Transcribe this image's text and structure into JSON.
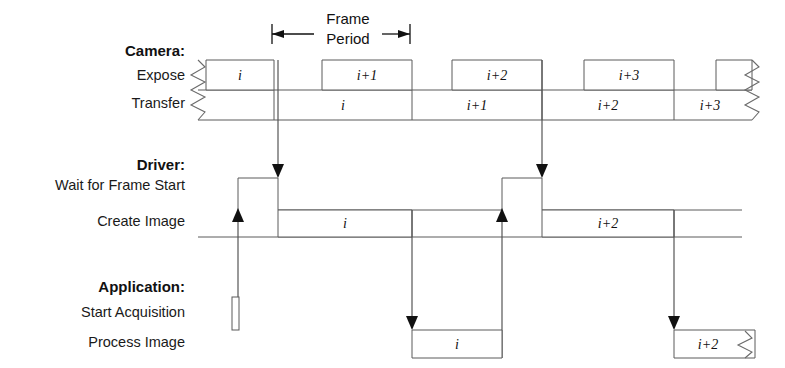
{
  "figure": {
    "type": "timing-diagram",
    "title_visible": false,
    "background_color": "#ffffff",
    "line_color": "#5a5a5a",
    "text_color": "#111111"
  },
  "annotations": {
    "frame_period_line1": "Frame",
    "frame_period_line2": "Period",
    "frame_period_span": {
      "x_start": 272,
      "x_end": 410
    }
  },
  "groups": [
    {
      "id": "camera",
      "title": "Camera:",
      "rows": [
        {
          "id": "expose",
          "label": "Expose"
        },
        {
          "id": "transfer",
          "label": "Transfer"
        }
      ]
    },
    {
      "id": "driver",
      "title": "Driver:",
      "rows": [
        {
          "id": "wait-for-frame-start",
          "label": "Wait for Frame Start"
        },
        {
          "id": "create-image",
          "label": "Create Image"
        }
      ]
    },
    {
      "id": "application",
      "title": "Application:",
      "rows": [
        {
          "id": "start-acquisition",
          "label": "Start Acquisition"
        },
        {
          "id": "process-image",
          "label": "Process Image"
        }
      ]
    }
  ],
  "blocks": {
    "expose": [
      {
        "label": "i",
        "x": 206,
        "w": 68
      },
      {
        "label": "i+1",
        "x": 322,
        "w": 90
      },
      {
        "label": "i+2",
        "x": 452,
        "w": 90
      },
      {
        "label": "i+3",
        "x": 584,
        "w": 90
      },
      {
        "label": "",
        "x": 716,
        "w": 40
      }
    ],
    "transfer": [
      {
        "label": "i",
        "x": 274,
        "w": 138
      },
      {
        "label": "i+1",
        "x": 412,
        "w": 130
      },
      {
        "label": "i+2",
        "x": 542,
        "w": 132
      },
      {
        "label": "i+3",
        "x": 674,
        "w": 68
      }
    ],
    "create_image": [
      {
        "label": "i",
        "x": 278,
        "w": 134
      },
      {
        "label": "i+2",
        "x": 542,
        "w": 132
      }
    ],
    "process_image": [
      {
        "label": "i",
        "x": 412,
        "w": 90
      },
      {
        "label": "i+2",
        "x": 674,
        "w": 85
      }
    ],
    "start_acquisition": [
      {
        "label": "",
        "x": 232,
        "w": 7
      }
    ]
  },
  "signal_edges": {
    "frame_start_arrows_x": [
      278,
      542
    ],
    "create_image_return_arrows_x": [
      238,
      502
    ],
    "process_image_arrows_x": [
      412,
      674
    ]
  },
  "zigzag_markers": {
    "left_break_x": 198,
    "right_break_camera_x": 752,
    "right_break_process_x": 755
  },
  "rows_geometry": {
    "expose_top": 60,
    "expose_bottom": 90,
    "transfer_top": 90,
    "transfer_bottom": 120,
    "wait_top": 178,
    "wait_bottom": 210,
    "create_top": 210,
    "create_bottom": 237,
    "start_acq_top": 297,
    "start_acq_bottom": 330,
    "process_top": 330,
    "process_bottom": 358
  }
}
